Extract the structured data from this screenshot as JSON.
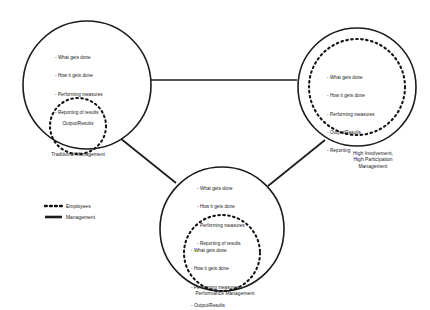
{
  "diagram": {
    "legend": {
      "name": "legend",
      "items": [
        {
          "id": "employees",
          "label": "Employees",
          "line_style": "dashed",
          "color": "#141414"
        },
        {
          "id": "management",
          "label": "Management",
          "line_style": "solid",
          "color": "#1c1c1c"
        }
      ]
    },
    "nodes": [
      {
        "id": "traditional-management",
        "caption": "Traditional Management",
        "outer_circle": {
          "owner": "Management",
          "line_style": "solid",
          "items": [
            "- What gets done",
            "- How it gets done",
            "- Performing measures",
            "- Reporting of results"
          ]
        },
        "inner_circle": {
          "owner": "Employees",
          "line_style": "dashed",
          "label": "Output/Results",
          "items": []
        }
      },
      {
        "id": "high-involvement-management",
        "caption": "High Involvement,\nHigh Participation\nManagement",
        "outer_circle": {
          "owner": "Management",
          "line_style": "solid",
          "items": []
        },
        "inner_circle": {
          "owner": "Employees",
          "line_style": "dashed",
          "label": "",
          "items": [
            "- What gets done",
            "- How it gets done",
            "- Performing measures",
            "- Output/Results",
            "- Reporting"
          ]
        }
      },
      {
        "id": "performance-management",
        "caption": "Performance Management",
        "outer_circle": {
          "owner": "Management",
          "line_style": "solid",
          "items": [
            "- What gets done",
            "- How it gets done",
            "- Performing measures",
            "- Reporting of results"
          ]
        },
        "inner_circle": {
          "owner": "Employees",
          "line_style": "dashed",
          "label": "",
          "items": [
            "- What gets done",
            "- How it gets done",
            "- Performing measures",
            "- Output/Results"
          ]
        }
      }
    ],
    "connectors": [
      {
        "id": "left-to-right",
        "from": "traditional-management",
        "to": "high-involvement-management",
        "line_style": "solid"
      },
      {
        "id": "left-to-bottom",
        "from": "traditional-management",
        "to": "performance-management",
        "line_style": "solid"
      },
      {
        "id": "right-to-bottom",
        "from": "high-involvement-management",
        "to": "performance-management",
        "line_style": "solid"
      }
    ],
    "colors": {
      "background": "#ffffff",
      "stroke": "#1c1c1c",
      "dashed_stroke": "#141414",
      "text": "#161616"
    }
  }
}
